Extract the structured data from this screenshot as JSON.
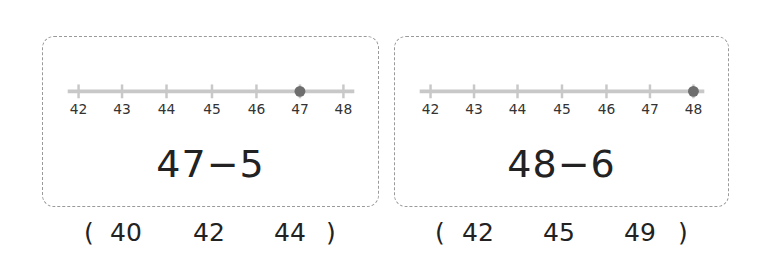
{
  "problems": [
    {
      "number_line": {
        "ticks": [
          "42",
          "43",
          "44",
          "45",
          "46",
          "47",
          "48"
        ],
        "marked": "47"
      },
      "expression": "47−5",
      "choices": {
        "open_paren": "(",
        "options": [
          "40",
          "42",
          "44"
        ],
        "close_paren": ")"
      }
    },
    {
      "number_line": {
        "ticks": [
          "42",
          "43",
          "44",
          "45",
          "46",
          "47",
          "48"
        ],
        "marked": "48"
      },
      "expression": "48−6",
      "choices": {
        "open_paren": "(",
        "options": [
          "42",
          "45",
          "49"
        ],
        "close_paren": ")"
      }
    }
  ],
  "colors": {
    "line": "#c8c8c8",
    "dot": "#6e6e6e",
    "border": "#9a9a9a",
    "text": "#222222"
  }
}
